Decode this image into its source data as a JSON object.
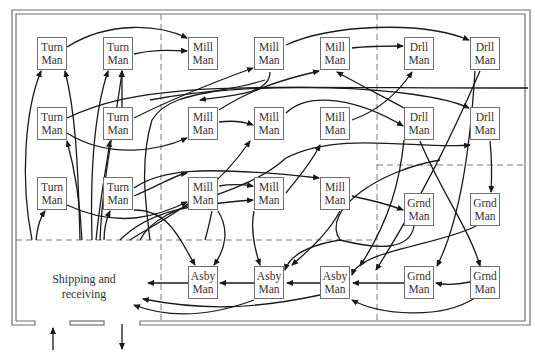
{
  "diagram": {
    "type": "process-layout-flow",
    "colors": {
      "line": "#1a1a1a",
      "wall": "#6e6e6e",
      "dash": "#7a7a7a",
      "box_border": "#707070",
      "text": "#333333"
    },
    "area_label": {
      "line1": "Shipping and",
      "line2": "receiving"
    },
    "machines": [
      {
        "id": "t1",
        "line1": "Turn",
        "line2": "Man",
        "x": 37,
        "y": 37
      },
      {
        "id": "t2",
        "line1": "Turn",
        "line2": "Man",
        "x": 103,
        "y": 37
      },
      {
        "id": "m1",
        "line1": "Mill",
        "line2": "Man",
        "x": 188,
        "y": 37
      },
      {
        "id": "m2",
        "line1": "Mill",
        "line2": "Man",
        "x": 254,
        "y": 37
      },
      {
        "id": "m3",
        "line1": "Mill",
        "line2": "Man",
        "x": 320,
        "y": 37
      },
      {
        "id": "d1",
        "line1": "Drll",
        "line2": "Man",
        "x": 404,
        "y": 37
      },
      {
        "id": "d2",
        "line1": "Drll",
        "line2": "Man",
        "x": 470,
        "y": 37
      },
      {
        "id": "t3",
        "line1": "Turn",
        "line2": "Man",
        "x": 37,
        "y": 107
      },
      {
        "id": "t4",
        "line1": "Turn",
        "line2": "Man",
        "x": 103,
        "y": 107
      },
      {
        "id": "m4",
        "line1": "Mill",
        "line2": "Man",
        "x": 188,
        "y": 107
      },
      {
        "id": "m5",
        "line1": "Mill",
        "line2": "Man",
        "x": 254,
        "y": 107
      },
      {
        "id": "m6",
        "line1": "Mill",
        "line2": "Man",
        "x": 320,
        "y": 107
      },
      {
        "id": "d3",
        "line1": "Drll",
        "line2": "Man",
        "x": 404,
        "y": 107
      },
      {
        "id": "d4",
        "line1": "Drll",
        "line2": "Man",
        "x": 470,
        "y": 107
      },
      {
        "id": "t5",
        "line1": "Turn",
        "line2": "Man",
        "x": 37,
        "y": 177
      },
      {
        "id": "t6",
        "line1": "Turn",
        "line2": "Man",
        "x": 103,
        "y": 177
      },
      {
        "id": "m7",
        "line1": "Mill",
        "line2": "Man",
        "x": 188,
        "y": 177
      },
      {
        "id": "m8",
        "line1": "Mill",
        "line2": "Man",
        "x": 254,
        "y": 177
      },
      {
        "id": "m9",
        "line1": "Mill",
        "line2": "Man",
        "x": 320,
        "y": 177
      },
      {
        "id": "g1",
        "line1": "Grnd",
        "line2": "Man",
        "x": 404,
        "y": 193
      },
      {
        "id": "g2",
        "line1": "Grnd",
        "line2": "Man",
        "x": 470,
        "y": 193
      },
      {
        "id": "a1",
        "line1": "Asby",
        "line2": "Man",
        "x": 188,
        "y": 266
      },
      {
        "id": "a2",
        "line1": "Asby",
        "line2": "Man",
        "x": 254,
        "y": 266
      },
      {
        "id": "a3",
        "line1": "Asby",
        "line2": "Man",
        "x": 320,
        "y": 266
      },
      {
        "id": "g3",
        "line1": "Grnd",
        "line2": "Man",
        "x": 404,
        "y": 266
      },
      {
        "id": "g4",
        "line1": "Grnd",
        "line2": "Man",
        "x": 470,
        "y": 266
      }
    ]
  }
}
